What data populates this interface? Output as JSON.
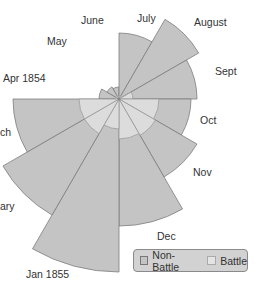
{
  "chart_data": {
    "type": "polar-area",
    "title": "",
    "center": [
      119,
      99
    ],
    "start_angle_deg": -90,
    "months": [
      "Apr 1854",
      "May",
      "June",
      "July",
      "August",
      "Sept",
      "Oct",
      "Nov",
      "Dec",
      "Jan 1855",
      "February",
      "March"
    ],
    "visible_labels": [
      "Apr 1854",
      "May",
      "June",
      "July",
      "August",
      "Sept",
      "Oct",
      "Nov",
      "Dec",
      "Jan 1855",
      "ary",
      "ch"
    ],
    "series": [
      {
        "name": "Non-Battle",
        "color": "#c4c4c4",
        "radii": [
          20,
          14,
          12,
          66,
          92,
          78,
          72,
          90,
          127,
          173,
          134,
          106
        ]
      },
      {
        "name": "Battle",
        "color": "#dcdcdc",
        "radii": [
          4,
          4,
          3,
          3,
          4,
          14,
          40,
          42,
          40,
          30,
          40,
          40
        ]
      }
    ],
    "legend": {
      "position": "bottom-right",
      "entries": [
        "Non-Battle",
        "Battle"
      ]
    }
  },
  "labels": [
    {
      "text": "June",
      "x": 81,
      "y": 24
    },
    {
      "text": "July",
      "x": 137,
      "y": 22
    },
    {
      "text": "August",
      "x": 194,
      "y": 26
    },
    {
      "text": "May",
      "x": 47,
      "y": 45
    },
    {
      "text": "Sept",
      "x": 215,
      "y": 75
    },
    {
      "text": "Apr 1854",
      "x": 3,
      "y": 82
    },
    {
      "text": "Oct",
      "x": 200,
      "y": 124
    },
    {
      "text": "ch",
      "x": 0,
      "y": 136
    },
    {
      "text": "Nov",
      "x": 193,
      "y": 176
    },
    {
      "text": "ary",
      "x": 0,
      "y": 210
    },
    {
      "text": "Dec",
      "x": 157,
      "y": 240
    },
    {
      "text": "Jan 1855",
      "x": 26,
      "y": 278
    }
  ],
  "legend": {
    "non_battle": "Non-Battle",
    "battle": "Battle"
  }
}
